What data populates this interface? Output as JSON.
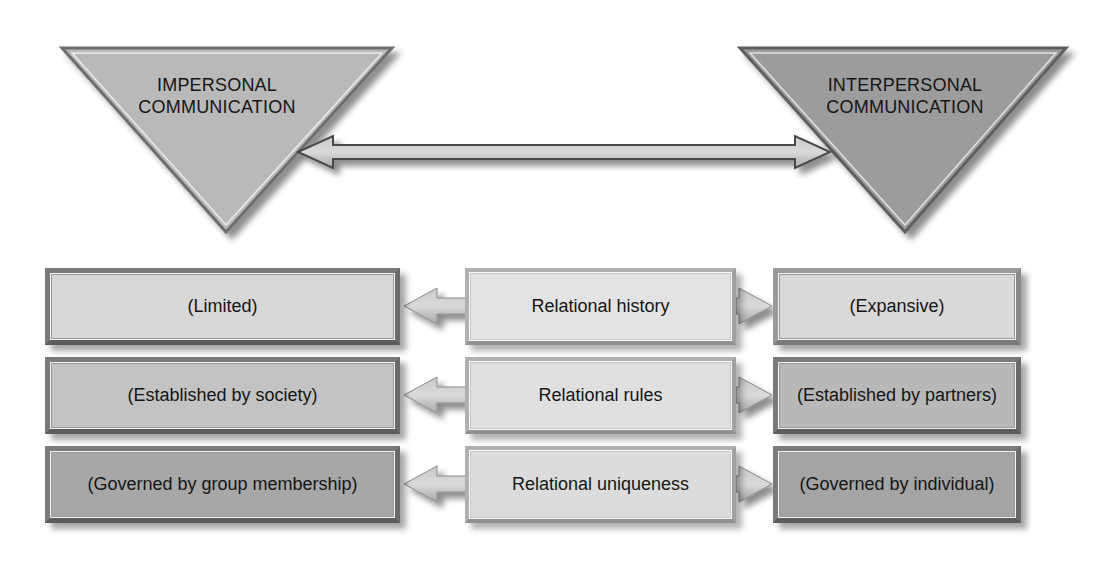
{
  "diagram": {
    "type": "comparison-continuum",
    "poles": {
      "left": {
        "label_line1": "IMPERSONAL",
        "label_line2": "COMMUNICATION",
        "fill": "#b8b8b8"
      },
      "right": {
        "label_line1": "INTERPERSONAL",
        "label_line2": "COMMUNICATION",
        "fill": "#9a9a9a"
      }
    },
    "connector": "double-arrow",
    "rows": [
      {
        "dimension": "Relational history",
        "impersonal": "(Limited)",
        "interpersonal": "(Expansive)",
        "side_fill": "#d6d6d6",
        "right_fill": "#d8d8d8"
      },
      {
        "dimension": "Relational rules",
        "impersonal": "(Established by society)",
        "interpersonal": "(Established by partners)",
        "side_fill": "#c2c2c2",
        "right_fill": "#b6b6b6"
      },
      {
        "dimension": "Relational uniqueness",
        "impersonal": "(Governed by group membership)",
        "interpersonal": "(Governed by individual)",
        "side_fill": "#a6a6a6",
        "right_fill": "#a2a2a2"
      }
    ],
    "colors": {
      "middle_fill": "#e0e0e0",
      "arrow_fill": "#b4b4b4",
      "outline": "#555555"
    }
  }
}
